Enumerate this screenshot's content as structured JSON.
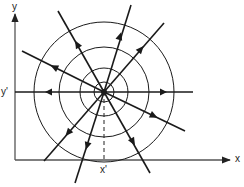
{
  "diagram": {
    "type": "radial-field-lines",
    "center": {
      "x": 104,
      "y": 92
    },
    "circle_radii": [
      10,
      24,
      45,
      70
    ],
    "axes": {
      "x_label": "x",
      "y_label": "y",
      "x_marker_label": "x'",
      "y_marker_label": "y'"
    },
    "rays": [
      {
        "name": "ray-west",
        "angle_deg": 180,
        "arrow": "outward"
      },
      {
        "name": "ray-east",
        "angle_deg": 0,
        "arrow": "outward"
      },
      {
        "name": "ray-nw",
        "angle_deg": 154,
        "arrow": "outward"
      },
      {
        "name": "ray-se",
        "angle_deg": -26,
        "arrow": "outward"
      },
      {
        "name": "ray-nnw",
        "angle_deg": 120,
        "arrow": "outward"
      },
      {
        "name": "ray-sse",
        "angle_deg": -60,
        "arrow": "outward"
      },
      {
        "name": "ray-nne",
        "angle_deg": 73,
        "arrow": "outward"
      },
      {
        "name": "ray-ssw",
        "angle_deg": -107,
        "arrow": "outward"
      },
      {
        "name": "ray-ne",
        "angle_deg": 49,
        "arrow": "outward"
      },
      {
        "name": "ray-sw",
        "angle_deg": -131,
        "arrow": "outward"
      }
    ],
    "line_color": "#1a1a1a",
    "axis_color": "#555555"
  }
}
